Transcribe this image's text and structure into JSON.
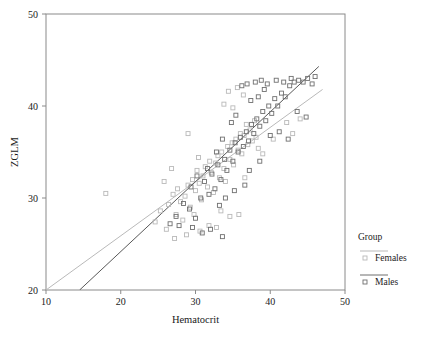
{
  "chart_data": {
    "type": "scatter",
    "title": "",
    "xlabel": "Hematocrit",
    "ylabel": "ZGLM",
    "xlim": [
      10,
      50
    ],
    "ylim": [
      20,
      50
    ],
    "xticks": [
      10,
      20,
      30,
      40,
      50
    ],
    "yticks": [
      20,
      30,
      40,
      50
    ],
    "grid": false,
    "legend": {
      "title": "Group",
      "position": "right",
      "entries": [
        {
          "name": "Females",
          "color": "#b9b9b9",
          "marker": "open-square"
        },
        {
          "name": "Males",
          "color": "#6f6f6f",
          "marker": "open-square"
        }
      ]
    },
    "series": [
      {
        "name": "Females",
        "color": "#b9b9b9",
        "marker": "open-square",
        "fit_line": {
          "x": [
            10.0,
            47.0
          ],
          "y": [
            20.0,
            41.8
          ],
          "color": "#b9b9b9"
        },
        "points": [
          [
            18.0,
            30.5
          ],
          [
            24.6,
            27.4
          ],
          [
            25.3,
            28.6
          ],
          [
            26.1,
            26.6
          ],
          [
            26.4,
            29.3
          ],
          [
            27.0,
            30.4
          ],
          [
            27.4,
            28.2
          ],
          [
            27.6,
            31.0
          ],
          [
            28.0,
            29.6
          ],
          [
            28.3,
            27.6
          ],
          [
            28.6,
            30.2
          ],
          [
            29.0,
            31.4
          ],
          [
            29.3,
            29.0
          ],
          [
            29.6,
            32.0
          ],
          [
            30.0,
            30.8
          ],
          [
            30.2,
            33.0
          ],
          [
            30.5,
            31.6
          ],
          [
            30.8,
            29.8
          ],
          [
            31.0,
            32.4
          ],
          [
            31.3,
            33.4
          ],
          [
            31.6,
            31.2
          ],
          [
            31.9,
            34.0
          ],
          [
            32.1,
            32.8
          ],
          [
            32.4,
            30.6
          ],
          [
            32.7,
            33.8
          ],
          [
            33.0,
            34.6
          ],
          [
            33.2,
            32.2
          ],
          [
            33.5,
            35.0
          ],
          [
            33.8,
            33.2
          ],
          [
            34.0,
            31.8
          ],
          [
            34.3,
            35.6
          ],
          [
            34.6,
            34.2
          ],
          [
            34.9,
            36.0
          ],
          [
            35.1,
            33.6
          ],
          [
            35.4,
            36.4
          ],
          [
            35.7,
            35.2
          ],
          [
            36.0,
            37.0
          ],
          [
            36.2,
            34.8
          ],
          [
            36.5,
            36.8
          ],
          [
            36.8,
            38.0
          ],
          [
            37.0,
            35.8
          ],
          [
            37.3,
            37.4
          ],
          [
            37.6,
            36.2
          ],
          [
            37.9,
            38.4
          ],
          [
            38.1,
            36.6
          ],
          [
            29.0,
            37.0
          ],
          [
            30.4,
            34.4
          ],
          [
            33.4,
            28.6
          ],
          [
            34.6,
            28.0
          ],
          [
            35.8,
            28.2
          ],
          [
            36.6,
            32.2
          ],
          [
            38.4,
            35.4
          ],
          [
            39.0,
            34.8
          ],
          [
            40.4,
            36.4
          ],
          [
            42.2,
            38.2
          ],
          [
            43.0,
            37.0
          ],
          [
            44.0,
            38.6
          ],
          [
            27.2,
            25.6
          ],
          [
            28.8,
            26.0
          ],
          [
            31.8,
            27.0
          ],
          [
            25.8,
            31.8
          ],
          [
            26.8,
            33.2
          ],
          [
            33.8,
            40.2
          ],
          [
            34.4,
            41.6
          ],
          [
            35.0,
            39.8
          ],
          [
            35.6,
            42.0
          ],
          [
            36.4,
            41.2
          ],
          [
            30.6,
            26.4
          ],
          [
            32.8,
            26.8
          ],
          [
            29.8,
            28.2
          ]
        ]
      },
      {
        "name": "Males",
        "color": "#6f6f6f",
        "marker": "open-square",
        "fit_line": {
          "x": [
            14.5,
            46.5
          ],
          "y": [
            20.0,
            44.3
          ],
          "color": "#585858"
        },
        "points": [
          [
            27.8,
            27.0
          ],
          [
            29.2,
            28.8
          ],
          [
            30.0,
            27.8
          ],
          [
            30.7,
            30.0
          ],
          [
            31.2,
            31.8
          ],
          [
            31.8,
            30.4
          ],
          [
            32.2,
            32.6
          ],
          [
            32.6,
            31.0
          ],
          [
            33.0,
            33.6
          ],
          [
            33.4,
            32.0
          ],
          [
            33.9,
            34.2
          ],
          [
            34.2,
            33.0
          ],
          [
            34.6,
            35.2
          ],
          [
            35.0,
            34.0
          ],
          [
            35.3,
            36.0
          ],
          [
            35.7,
            35.0
          ],
          [
            36.0,
            36.6
          ],
          [
            36.4,
            35.6
          ],
          [
            36.8,
            37.2
          ],
          [
            37.1,
            36.2
          ],
          [
            37.5,
            38.0
          ],
          [
            37.8,
            37.0
          ],
          [
            38.2,
            38.6
          ],
          [
            38.6,
            37.8
          ],
          [
            39.0,
            39.4
          ],
          [
            39.4,
            38.4
          ],
          [
            39.8,
            40.0
          ],
          [
            40.2,
            39.2
          ],
          [
            40.6,
            40.8
          ],
          [
            41.0,
            40.0
          ],
          [
            41.5,
            41.4
          ],
          [
            42.0,
            41.0
          ],
          [
            42.6,
            42.2
          ],
          [
            43.2,
            42.6
          ],
          [
            43.8,
            42.8
          ],
          [
            44.4,
            42.6
          ],
          [
            45.0,
            43.0
          ],
          [
            45.6,
            42.4
          ],
          [
            46.0,
            43.2
          ],
          [
            38.0,
            42.6
          ],
          [
            38.8,
            42.8
          ],
          [
            39.6,
            42.4
          ],
          [
            40.8,
            42.8
          ],
          [
            41.8,
            42.6
          ],
          [
            42.8,
            43.0
          ],
          [
            36.2,
            42.2
          ],
          [
            36.9,
            42.4
          ],
          [
            37.4,
            40.6
          ],
          [
            38.4,
            41.0
          ],
          [
            39.2,
            41.8
          ],
          [
            40.0,
            36.8
          ],
          [
            41.2,
            37.2
          ],
          [
            42.4,
            36.4
          ],
          [
            43.6,
            39.4
          ],
          [
            44.8,
            38.8
          ],
          [
            34.8,
            38.2
          ],
          [
            35.4,
            39.0
          ],
          [
            33.6,
            36.4
          ],
          [
            32.8,
            35.0
          ],
          [
            31.6,
            33.2
          ],
          [
            30.2,
            32.4
          ],
          [
            29.4,
            31.2
          ],
          [
            28.4,
            29.4
          ],
          [
            27.4,
            28.0
          ],
          [
            26.6,
            27.2
          ],
          [
            35.2,
            30.8
          ],
          [
            36.6,
            31.4
          ],
          [
            33.2,
            29.2
          ],
          [
            34.0,
            30.0
          ],
          [
            37.2,
            33.0
          ],
          [
            38.6,
            34.0
          ],
          [
            30.9,
            26.2
          ],
          [
            32.0,
            26.6
          ],
          [
            33.6,
            25.8
          ],
          [
            29.6,
            26.8
          ]
        ]
      }
    ]
  }
}
